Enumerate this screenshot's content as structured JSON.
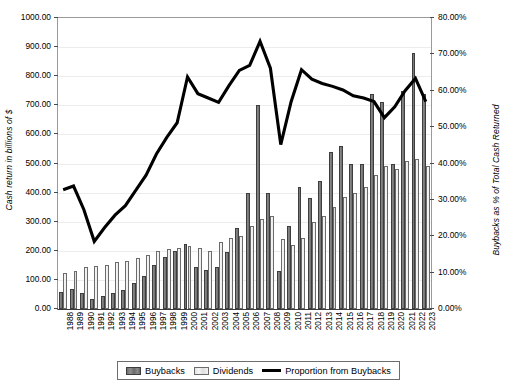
{
  "chart_data": {
    "type": "bar",
    "title": "",
    "subtitle": "",
    "xlabel": "",
    "ylabel": "Cash return in billions of $",
    "ylabel_secondary": "Buybacks as % of Total Cash Returned",
    "ylim": [
      0,
      1000
    ],
    "ylim_secondary": [
      0,
      80
    ],
    "ytick_labels": [
      "0.00",
      "100.00",
      "200.00",
      "300.00",
      "400.00",
      "500.00",
      "600.00",
      "700.00",
      "800.00",
      "900.00",
      "1000.00"
    ],
    "ytick_values": [
      0,
      100,
      200,
      300,
      400,
      500,
      600,
      700,
      800,
      900,
      1000
    ],
    "ytick_labels_secondary": [
      "0.00%",
      "10.00%",
      "20.00%",
      "30.00%",
      "40.00%",
      "50.00%",
      "60.00%",
      "70.00%",
      "80.00%"
    ],
    "ytick_values_secondary": [
      0,
      10,
      20,
      30,
      40,
      50,
      60,
      70,
      80
    ],
    "grid": true,
    "legend_position": "bottom",
    "categories": [
      "1988",
      "1989",
      "1990",
      "1991",
      "1992",
      "1993",
      "1994",
      "1995",
      "1996",
      "1997",
      "1998",
      "1999",
      "2000",
      "2001",
      "2002",
      "2003",
      "2004",
      "2005",
      "2006",
      "2007",
      "2008",
      "2009",
      "2010",
      "2011",
      "2012",
      "2013",
      "2014",
      "2015",
      "2016",
      "2017",
      "2018",
      "2019",
      "2020",
      "2021",
      "2022",
      "2023"
    ],
    "series": [
      {
        "name": "Buybacks",
        "axis": "left",
        "type": "bar",
        "color": "#767676",
        "values": [
          60,
          70,
          55,
          35,
          44,
          55,
          65,
          90,
          115,
          150,
          180,
          200,
          225,
          145,
          135,
          145,
          195,
          280,
          400,
          700,
          400,
          130,
          285,
          420,
          380,
          440,
          540,
          560,
          500,
          500,
          740,
          710,
          500,
          750,
          880,
          740
        ]
      },
      {
        "name": "Dividends",
        "axis": "left",
        "type": "bar",
        "color": "#e9e9e9",
        "values": [
          125,
          130,
          145,
          148,
          152,
          160,
          165,
          175,
          185,
          200,
          205,
          210,
          215,
          210,
          200,
          230,
          245,
          250,
          285,
          310,
          320,
          240,
          220,
          245,
          300,
          320,
          350,
          385,
          400,
          420,
          460,
          490,
          480,
          510,
          515,
          490
        ]
      },
      {
        "name": "Proportion from Buybacks",
        "axis": "right",
        "type": "line",
        "color": "#000000",
        "values": [
          32.8,
          33.8,
          27.3,
          18.6,
          22.4,
          25.8,
          28.4,
          32.6,
          36.8,
          42.6,
          47.2,
          51.2,
          63.8,
          59.2,
          58.0,
          56.8,
          61.4,
          65.6,
          67.0,
          73.6,
          66.2,
          45.2,
          57.0,
          65.8,
          63.2,
          62.0,
          61.2,
          60.2,
          58.6,
          58.0,
          57.0,
          52.6,
          55.6,
          60.0,
          63.4,
          57.0
        ]
      }
    ],
    "legend": [
      {
        "label": "Buybacks",
        "marker": "bar-swatch-dark"
      },
      {
        "label": "Dividends",
        "marker": "bar-swatch-light"
      },
      {
        "label": "Proportion from Buybacks",
        "marker": "line-swatch-black"
      }
    ]
  }
}
